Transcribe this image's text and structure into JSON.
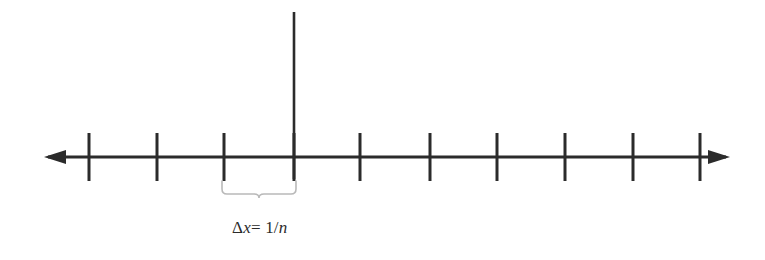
{
  "figure": {
    "type": "number-line-partition-diagram",
    "background_color": "#ffffff",
    "ink_color": "#2b2b2b",
    "brace_color": "#b9b9b9",
    "label": {
      "full_text": "Δx= 1/n",
      "delta_symbol": "Δ",
      "variable": "x",
      "equals": "=",
      "numerator": "1/",
      "denominator": "n",
      "x_px": 232,
      "baseline_y_px": 235,
      "font_size_px": 17
    },
    "axis": {
      "orientation": "horizontal",
      "y_px": 157,
      "left_arrow_tip_x_px": 44,
      "right_arrow_tip_x_px": 730,
      "stroke_width_px": 3,
      "arrowheads": [
        "left",
        "right"
      ]
    },
    "vertical_axis": {
      "x_px": 294,
      "top_y_px": 12,
      "bottom_y_px": 179,
      "stroke_width_px": 2.6
    },
    "ticks": {
      "count": 11,
      "spacing_px": 68,
      "top_y_px": 133,
      "bottom_y_px": 181,
      "stroke_width_px": 3,
      "x_positions_px": [
        89,
        157,
        224,
        294,
        360,
        430,
        497,
        565,
        633,
        700
      ],
      "origin_tick_x_px": 294
    },
    "brace": {
      "left_x_px": 222,
      "right_x_px": 296,
      "top_y_px": 181,
      "notch_y_px": 198,
      "stroke_width_px": 1.6,
      "describes": "Δx= 1/n",
      "spans_ticks": [
        3,
        4
      ]
    }
  },
  "chart_data": {
    "type": "line",
    "title": "",
    "xlabel": "",
    "ylabel": "",
    "annotations": [
      "Δx= 1/n"
    ],
    "tick_count": 11,
    "uniform_spacing": true,
    "origin_index": 3,
    "grid": false,
    "legend_position": "none"
  }
}
